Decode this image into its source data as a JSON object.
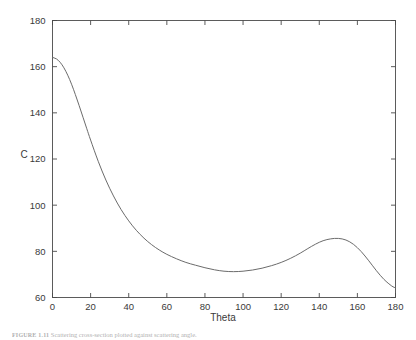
{
  "figure": {
    "caption_label": "FIGURE 1.11",
    "caption_text": "Scattering cross-section plotted against scattering angle."
  },
  "chart_data": {
    "type": "line",
    "title": "",
    "xlabel": "Theta",
    "ylabel": "C",
    "xlim": [
      0,
      180
    ],
    "ylim": [
      60,
      180
    ],
    "xticks": [
      0,
      20,
      40,
      60,
      80,
      100,
      120,
      140,
      160,
      180
    ],
    "yticks": [
      60,
      80,
      100,
      120,
      140,
      160,
      180
    ],
    "xtick_labels": [
      "0",
      "20",
      "40",
      "60",
      "80",
      "100",
      "120",
      "140",
      "160",
      "180"
    ],
    "ytick_labels": [
      "60",
      "80",
      "100",
      "120",
      "140",
      "160",
      "180"
    ],
    "grid": false,
    "legend": null,
    "line_color": "#6b6b6b",
    "series": [
      {
        "name": "C vs Theta",
        "x": [
          0,
          2,
          4,
          6,
          8,
          10,
          12,
          14,
          16,
          18,
          20,
          24,
          28,
          32,
          36,
          40,
          44,
          48,
          52,
          56,
          60,
          65,
          70,
          75,
          80,
          85,
          90,
          95,
          100,
          105,
          110,
          115,
          120,
          125,
          130,
          134,
          138,
          142,
          146,
          150,
          154,
          158,
          162,
          166,
          170,
          174,
          178,
          180
        ],
        "y": [
          164.0,
          163.4,
          161.9,
          159.5,
          156.3,
          152.4,
          147.9,
          143.1,
          138.1,
          133.1,
          128.2,
          119.0,
          110.9,
          104.0,
          98.1,
          93.2,
          89.1,
          85.7,
          82.9,
          80.6,
          78.7,
          76.8,
          75.2,
          74.0,
          72.9,
          72.0,
          71.4,
          71.2,
          71.4,
          71.9,
          72.7,
          73.8,
          75.2,
          77.0,
          79.2,
          81.2,
          83.1,
          84.6,
          85.4,
          85.6,
          84.9,
          83.0,
          79.9,
          75.9,
          71.6,
          67.8,
          65.0,
          64.2
        ]
      }
    ],
    "annotations": {
      "start_value": 164.0,
      "minimum": {
        "x": 95,
        "y": 71.2
      },
      "local_maximum": {
        "x": 150,
        "y": 85.6
      },
      "end_value": 64.2
    }
  }
}
